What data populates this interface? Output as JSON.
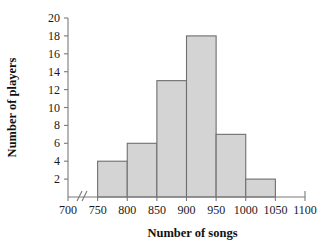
{
  "chart_data": {
    "type": "bar",
    "title": "",
    "xlabel": "Number of songs",
    "ylabel": "Number of players",
    "categories": [
      "750-800",
      "800-850",
      "850-900",
      "900-950",
      "950-1000",
      "1000-1050"
    ],
    "bin_edges": [
      750,
      800,
      850,
      900,
      950,
      1000,
      1050
    ],
    "values": [
      4,
      6,
      13,
      18,
      7,
      2
    ],
    "xlim": [
      700,
      1100
    ],
    "ylim": [
      0,
      20
    ],
    "x_ticks": [
      700,
      750,
      800,
      850,
      900,
      950,
      1000,
      1050,
      1100
    ],
    "y_ticks": [
      2,
      4,
      6,
      8,
      10,
      12,
      14,
      16,
      18,
      20
    ],
    "x_tick_labels": [
      "700",
      "750",
      "800",
      "850",
      "900",
      "950",
      "1000",
      "1050",
      "1100"
    ],
    "y_tick_labels": [
      "2",
      "4",
      "6",
      "8",
      "10",
      "12",
      "14",
      "16",
      "18",
      "20"
    ],
    "axis_break": true,
    "axis_break_axis": "x",
    "grid": false,
    "legend": false,
    "bar_fill_color": "#d4d4d4",
    "bar_edge_color": "#6e6e6e",
    "axis_color": "#7a7a7a",
    "text_color": "#111111"
  }
}
